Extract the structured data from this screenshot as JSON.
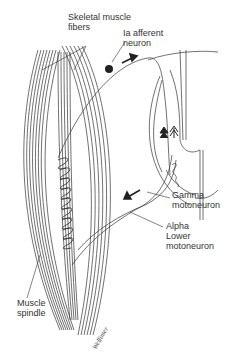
{
  "diagram": {
    "labels": {
      "skeletal_muscle_fibers": {
        "line1": "Skeletal muscle",
        "line2": "fibers"
      },
      "ia_afferent_neuron": {
        "line1": "Ia afferent",
        "line2": "neuron"
      },
      "gamma_motoneuron": {
        "line1": "Gamma",
        "line2": "motoneuron"
      },
      "alpha_lower_motoneuron": {
        "line1": "Alpha",
        "line2": "Lower",
        "line3": "motoneuron"
      },
      "muscle_spindle": {
        "line1": "Muscle",
        "line2": "spindle"
      }
    },
    "signature": "Wellimer",
    "colors": {
      "line": "#333333",
      "background": "#ffffff",
      "text": "#333333"
    }
  }
}
